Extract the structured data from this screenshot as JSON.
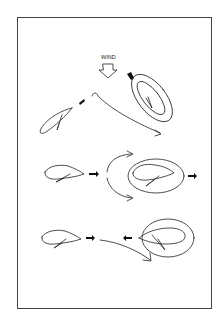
{
  "diagram": {
    "wind_label": "WIND",
    "colors": {
      "line": "#222222",
      "frame": "#444444",
      "background": "#ffffff"
    },
    "rows": [
      {
        "id": "top",
        "description": "Tilted wing approaching vortex ring; flow line curving under ring, wind from above"
      },
      {
        "id": "middle",
        "description": "Horizontal wing moving right into ring; split flow arrows above and below"
      },
      {
        "id": "bottom",
        "description": "Horizontal wing moving right; ring wing moving left with flow arrow curving below"
      }
    ]
  }
}
